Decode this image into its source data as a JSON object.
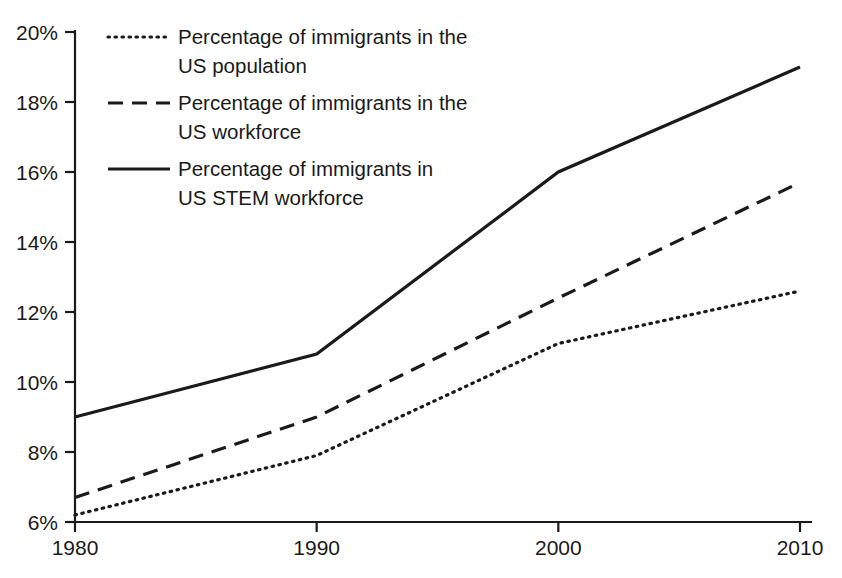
{
  "chart_data": {
    "type": "line",
    "title": "",
    "subtitle": "",
    "xlabel": "",
    "ylabel": "",
    "x": [
      1980,
      1990,
      2000,
      2010
    ],
    "xtick_labels": [
      "1980",
      "1990",
      "2000",
      "2010"
    ],
    "ytick_labels": [
      "6%",
      "8%",
      "10%",
      "12%",
      "14%",
      "16%",
      "18%",
      "20%"
    ],
    "ytick_values": [
      6,
      8,
      10,
      12,
      14,
      16,
      18,
      20
    ],
    "xlim": [
      1980,
      2010
    ],
    "ylim": [
      6,
      20
    ],
    "grid": false,
    "legend_position": "top-left-inside",
    "series": [
      {
        "name": "Percentage of immigrants in the US population",
        "label_line1": "Percentage of immigrants in the",
        "label_line2": "US population",
        "style": "dotted",
        "color": "#1a1a1a",
        "values": [
          6.2,
          7.9,
          11.1,
          12.6
        ]
      },
      {
        "name": "Percentage of immigrants in the US workforce",
        "label_line1": "Percentage of immigrants in the",
        "label_line2": "US workforce",
        "style": "dashed",
        "color": "#1a1a1a",
        "values": [
          6.7,
          9.0,
          12.4,
          15.7
        ]
      },
      {
        "name": "Percentage of immigrants in US STEM workforce",
        "label_line1": "Percentage of immigrants in",
        "label_line2": "US STEM workforce",
        "style": "solid",
        "color": "#1a1a1a",
        "values": [
          9.0,
          10.8,
          16.0,
          19.0
        ]
      }
    ]
  },
  "axes": {
    "y_ticks": [
      {
        "label": "20%"
      },
      {
        "label": "18%"
      },
      {
        "label": "16%"
      },
      {
        "label": "14%"
      },
      {
        "label": "12%"
      },
      {
        "label": "10%"
      },
      {
        "label": "8%"
      },
      {
        "label": "6%"
      }
    ],
    "x_ticks": [
      {
        "label": "1980"
      },
      {
        "label": "1990"
      },
      {
        "label": "2000"
      },
      {
        "label": "2010"
      }
    ]
  },
  "legend": {
    "entries": [
      {
        "marker": "dotted-line-icon",
        "line1": "Percentage of immigrants in the",
        "line2": "US population"
      },
      {
        "marker": "dashed-line-icon",
        "line1": "Percentage of immigrants in the",
        "line2": "US workforce"
      },
      {
        "marker": "solid-line-icon",
        "line1": "Percentage of immigrants in",
        "line2": "US STEM workforce"
      }
    ]
  },
  "colors": {
    "ink": "#1a1a1a",
    "background": "#ffffff"
  }
}
